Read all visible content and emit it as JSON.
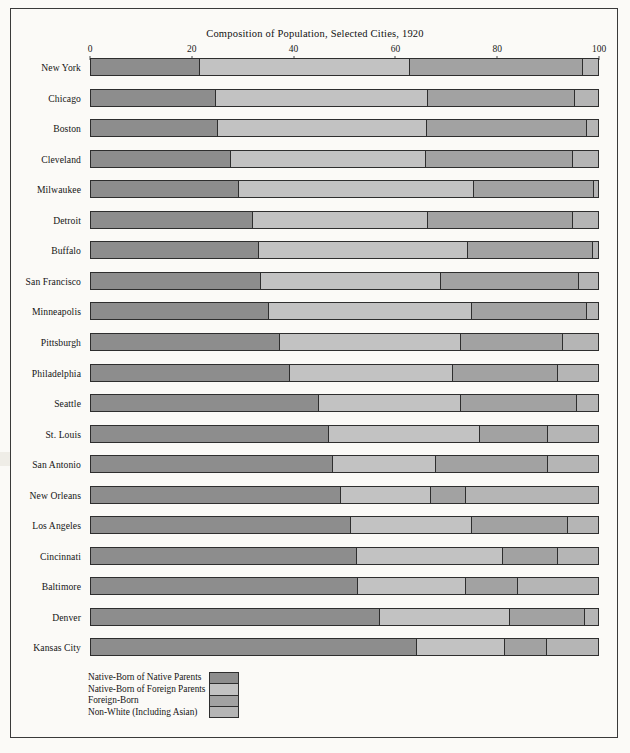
{
  "chart_data": {
    "type": "bar",
    "orientation": "horizontal",
    "stacked": true,
    "normalized_percent": true,
    "title": "Composition of Population, Selected Cities, 1920",
    "xlabel": "",
    "ylabel": "",
    "xlim": [
      0,
      100
    ],
    "xticks": [
      0,
      20,
      40,
      60,
      80,
      100
    ],
    "xtick_labels": [
      "0",
      "20",
      "40",
      "60",
      "80",
      "100"
    ],
    "grid": false,
    "legend_position": "bottom-left",
    "legend_entries": [
      "Native-Born of Native Parents",
      "Native-Born of Foreign Parents",
      "Foreign-Born",
      "Non-White (Including Asian)"
    ],
    "series": [
      {
        "name": "Native-Born of Native Parents",
        "color": "#8d8d8d",
        "values": [
          21.4,
          24.4,
          24.9,
          27.4,
          29.0,
          31.8,
          32.9,
          33.4,
          35.0,
          37.1,
          39.1,
          44.8,
          46.8,
          47.5,
          49.1,
          51.1,
          52.3,
          52.5,
          56.8,
          64.2
        ]
      },
      {
        "name": "Native-Born of Foreign Parents",
        "color": "#c2c2c2",
        "values": [
          41.3,
          41.8,
          41.1,
          38.4,
          46.4,
          34.4,
          41.2,
          35.4,
          40.0,
          35.6,
          32.2,
          27.9,
          29.8,
          20.3,
          17.7,
          23.9,
          28.8,
          21.2,
          25.7,
          17.3
        ]
      },
      {
        "name": "Foreign-Born",
        "color": "#a2a2a2",
        "values": [
          34.2,
          29.1,
          31.6,
          29.1,
          23.6,
          28.7,
          24.7,
          27.3,
          22.6,
          20.2,
          20.7,
          23.0,
          13.4,
          22.2,
          6.9,
          18.9,
          10.8,
          10.4,
          14.7,
          8.3
        ]
      },
      {
        "name": "Non-White (Including Asian)",
        "color": "#b5b5b5",
        "values": [
          3.1,
          4.7,
          2.4,
          5.1,
          1.0,
          5.1,
          1.2,
          3.9,
          2.4,
          7.1,
          7.9,
          4.3,
          10.0,
          9.8,
          26.3,
          6.1,
          8.1,
          15.9,
          2.8,
          10.2
        ]
      }
    ],
    "categories": [
      "New York",
      "Chicago",
      "Boston",
      "Cleveland",
      "Milwaukee",
      "Detroit",
      "Buffalo",
      "San Francisco",
      "Minneapolis",
      "Pittsburgh",
      "Philadelphia",
      "Seattle",
      "St. Louis",
      "San Antonio",
      "New Orleans",
      "Los Angeles",
      "Cincinnati",
      "Baltimore",
      "Denver",
      "Kansas City"
    ],
    "colors": {
      "native_born_native_parents": "#8d8d8d",
      "native_born_foreign_parents": "#c2c2c2",
      "foreign_born": "#a2a2a2",
      "non_white": "#b5b5b5",
      "frame": "#3a3a3a",
      "background": "#fbfaf7"
    }
  }
}
